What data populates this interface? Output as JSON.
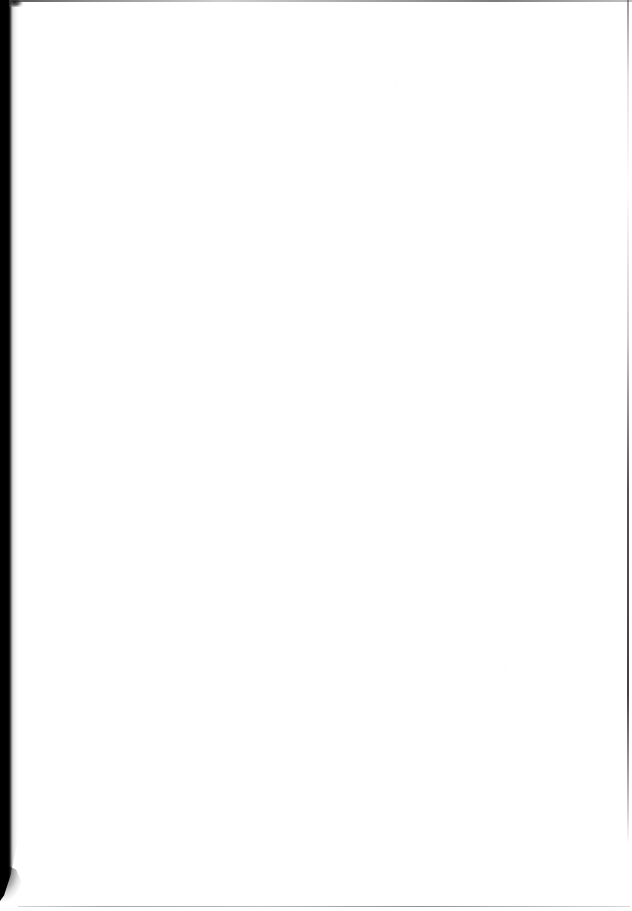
{
  "document": {
    "page_kind": "scanned-blank-page",
    "page_text": "",
    "page_width": 632,
    "page_height": 911
  },
  "colors": {
    "paper": "#ffffff",
    "gutter_shadow": "#000000",
    "edge_line": "#5a5a5a",
    "artifact": "#1a1a1a"
  },
  "artifacts": {
    "gutter_label": "left-spine-scan-shadow",
    "top_edge_label": "top-page-edge-line",
    "right_edge_label": "right-page-edge-line",
    "bottom_edge_label": "bottom-page-edge-line",
    "corner_smudge_label": "top-left-scan-smudge",
    "noise_label": "paper-grain-and-dust-speckle",
    "wedge_label": "bottom-left-gutter-taper"
  }
}
